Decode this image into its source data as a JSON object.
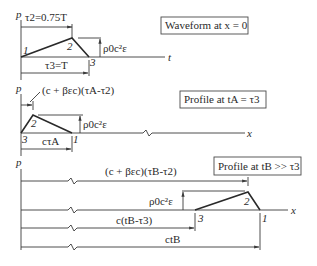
{
  "panels": [
    {
      "title": "Waveform at x = 0",
      "y_axis_label": "p",
      "x_axis_label": "t",
      "points": [
        "1",
        "2",
        "3"
      ],
      "dims": {
        "top": "τ2=0.75T",
        "bottom": "τ3=T",
        "amplitude": "ρ0c²ε"
      }
    },
    {
      "title": "Profile at tA = τ3",
      "y_axis_label": "p",
      "x_axis_label": "x",
      "points": [
        "3",
        "2",
        "1"
      ],
      "dims": {
        "top": "(c + βεc)(τA-τ2)",
        "bottom": "cτA",
        "amplitude": "ρ0c²ε"
      }
    },
    {
      "title": "Profile at tB >> τ3",
      "y_axis_label": "p",
      "x_axis_label": "x",
      "points": [
        "3",
        "2",
        "1"
      ],
      "dims": {
        "top": "(c + βεc)(τB-τ2)",
        "middle": "c(tB-τ3)",
        "bottom": "ctB",
        "amplitude": "ρ0c²ε"
      }
    }
  ]
}
